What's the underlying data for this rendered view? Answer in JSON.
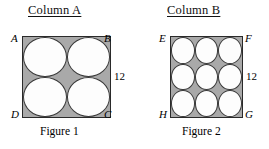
{
  "columns": [
    {
      "heading": "Column A"
    },
    {
      "heading": "Column B"
    }
  ],
  "figures": [
    {
      "caption": "Figure 1",
      "side_length_label": "12",
      "vertices": {
        "top_left": "A",
        "top_right": "B",
        "bottom_left": "D",
        "bottom_right": "C"
      },
      "circle_rows": 2,
      "circle_columns": 3
    },
    {
      "caption": "Figure 2",
      "side_length_label": "12",
      "vertices": {
        "top_left": "E",
        "top_right": "F",
        "bottom_left": "H",
        "bottom_right": "G"
      },
      "circle_rows": 3,
      "circle_columns": 3
    }
  ],
  "colors": {
    "square_fill": "#a9a9a9",
    "circle_fill": "#fdfdfd",
    "outline": "#2a2a2a",
    "background": "#ffffff",
    "text": "#000000"
  }
}
